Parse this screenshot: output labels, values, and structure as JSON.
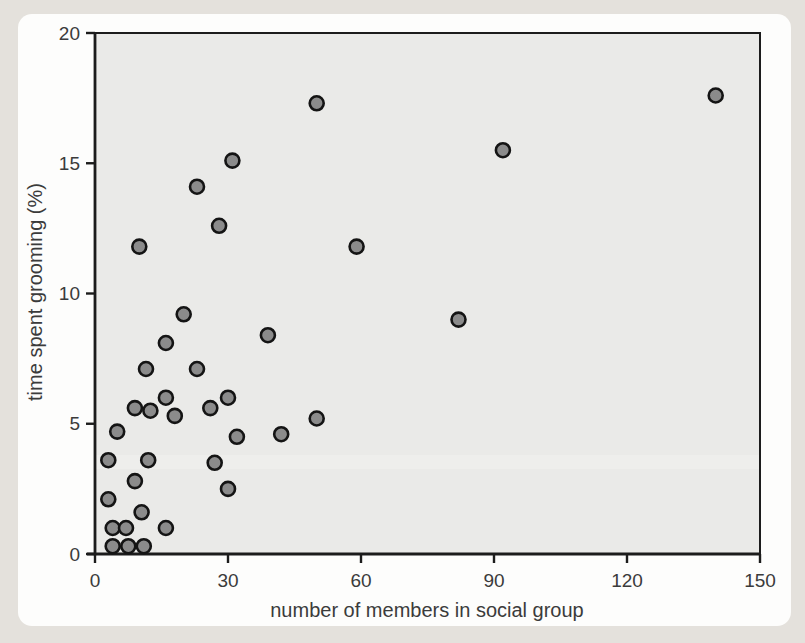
{
  "chart_data": {
    "type": "scatter",
    "title": "",
    "xlabel": "number of members in social group",
    "ylabel": "time spent grooming (%)",
    "xlim": [
      0,
      150
    ],
    "ylim": [
      0,
      20
    ],
    "x_ticks": [
      0,
      30,
      60,
      90,
      120,
      150
    ],
    "y_ticks": [
      0,
      5,
      10,
      15,
      20
    ],
    "grid": false,
    "legend": null,
    "points": [
      {
        "x": 4,
        "y": 0.3
      },
      {
        "x": 7.5,
        "y": 0.3
      },
      {
        "x": 11,
        "y": 0.3
      },
      {
        "x": 4,
        "y": 1.0
      },
      {
        "x": 7,
        "y": 1.0
      },
      {
        "x": 16,
        "y": 1.0
      },
      {
        "x": 10.5,
        "y": 1.6
      },
      {
        "x": 3,
        "y": 2.1
      },
      {
        "x": 9,
        "y": 2.8
      },
      {
        "x": 30,
        "y": 2.5
      },
      {
        "x": 3,
        "y": 3.6
      },
      {
        "x": 12,
        "y": 3.6
      },
      {
        "x": 27,
        "y": 3.5
      },
      {
        "x": 5,
        "y": 4.7
      },
      {
        "x": 32,
        "y": 4.5
      },
      {
        "x": 42,
        "y": 4.6
      },
      {
        "x": 9,
        "y": 5.6
      },
      {
        "x": 12.5,
        "y": 5.5
      },
      {
        "x": 18,
        "y": 5.3
      },
      {
        "x": 26,
        "y": 5.6
      },
      {
        "x": 16,
        "y": 6.0
      },
      {
        "x": 30,
        "y": 6.0
      },
      {
        "x": 50,
        "y": 5.2
      },
      {
        "x": 11.5,
        "y": 7.1
      },
      {
        "x": 23,
        "y": 7.1
      },
      {
        "x": 16,
        "y": 8.1
      },
      {
        "x": 20,
        "y": 9.2
      },
      {
        "x": 39,
        "y": 8.4
      },
      {
        "x": 82,
        "y": 9.0
      },
      {
        "x": 10,
        "y": 11.8
      },
      {
        "x": 59,
        "y": 11.8
      },
      {
        "x": 28,
        "y": 12.6
      },
      {
        "x": 23,
        "y": 14.1
      },
      {
        "x": 31,
        "y": 15.1
      },
      {
        "x": 92,
        "y": 15.5
      },
      {
        "x": 50,
        "y": 17.3
      },
      {
        "x": 140,
        "y": 17.6
      }
    ],
    "colors": {
      "page_background": "#e4e1dc",
      "panel_background": "#fdfdfc",
      "plot_background": "#eaeae8",
      "axis": "#1c1c1c",
      "point_fill": "#8b8b8b",
      "point_stroke": "#141414",
      "label_text": "#3b3b3b"
    },
    "marker_radius": 7
  }
}
